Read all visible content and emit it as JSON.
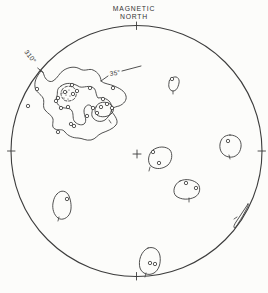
{
  "figure": {
    "kind": "contoured stereonet (equal-area projection) of poles",
    "bg_color": "#fcfcfa",
    "ink_color": "#3d3d3d"
  },
  "labels": {
    "north_line1": "MAGNETIC",
    "north_line2": "NORTH",
    "azimuth_310": "310°",
    "dip_35": "35°"
  },
  "chart_data": {
    "type": "scatter",
    "legend_position": "none",
    "grid": false,
    "projection_circle": {
      "cx": 136.5,
      "cy": 151,
      "r": 125.5
    },
    "center_cross": {
      "x": 137,
      "y": 154,
      "arm": 4
    },
    "boundary_ticks_deg": [
      0,
      90,
      180,
      270,
      310
    ],
    "labeled_orientation": {
      "strike_deg": 310,
      "dip_deg": 35
    },
    "contours": [
      {
        "name": "cluster-outer",
        "dashed": false,
        "path": "M 41 71 C 38 75 34 80 35 87 C 35.5 92 41 94 43 98 C 45 102 42 106 45 110 C 48 114 52 115 53 119 C 53.5 123 51 127 55 129 C 59 131 62 128 65 132 C 68 136 73 138 78 138 C 82 138 86 141 91 140 C 96 139 97 135 102 133 C 107 131 113 129 116 125 C 119 121 115 116 112 112 C 110 109 114 107 119 106 C 124 104 127 100 126 96 C 125 91 119 88 114 86 C 110 84 104 84 101 81 C 101 77 98 72 93 70 C 89 68 85 72 80 69 C 75 66 69 67 64 70 C 59 73 58 78 53 81 C 49 83 45 79 44 75 C 43 72 42 70 41 71 Z"
      },
      {
        "name": "cluster-middle",
        "dashed": false,
        "path": "M 61 86 C 66 82 73 83 78 86 C 82 89 87 85 92 87 C 97 89 95 94 98 98 C 103 97 109 99 111 104 C 113 110 110 116 105 120 C 100 123 94 121 92 116 C 91 112 94 109 91 106 C 88 103 84 107 84 111 C 84 116 87 119 85 123 C 83 126 78 125 75 122 C 72 119 74 115 72 111 C 70 107 65 109 61 107 C 57 105 55 100 57 96 C 58 92 56 89 61 86 Z"
      },
      {
        "name": "cluster-core-stippled",
        "dashed": true,
        "path": "M 62 90 C 64 86 70 85 74 88 C 77 90 77 95 75 98 C 73 101 67 102 64 100 C 61 97 60 93 62 90 Z"
      },
      {
        "name": "cluster-core-east",
        "dashed": false,
        "path": "M 96 107 C 97 103 103 101 108 103 C 113 105 115 109 112 113 C 109 117 101 118 97 115 C 94 112 95 109 96 107 Z"
      },
      {
        "name": "isolated-north",
        "dashed": false,
        "path": "M 172 78 C 176 75 180 78 179 83 C 178 88 176 91 173 91 C 170 91 168 87 169 83 C 169 80 170 79 172 78 Z"
      },
      {
        "name": "isolated-east",
        "dashed": false,
        "path": "M 230 135 C 237 135 242 140 241 147 C 240 154 235 158 229 157 C 223 156 219 151 220 144 C 221 138 225 135 230 135 Z"
      },
      {
        "name": "isolated-center",
        "dashed": false,
        "path": "M 153 150 C 158 146 166 146 170 150 C 173 154 172 161 168 165 C 163 169 156 170 151 166 C 147 162 148 154 153 150 Z"
      },
      {
        "name": "isolated-southeast-center",
        "dashed": false,
        "path": "M 180 181 C 186 178 194 180 198 184 C 201 188 200 194 195 197 C 189 200 181 200 176 196 C 172 192 174 184 180 181 Z"
      },
      {
        "name": "isolated-south",
        "dashed": false,
        "path": "M 148 248 C 154 246 159 250 160 256 C 161 263 159 270 154 273 C 149 276 142 274 140 268 C 138 261 141 251 148 248 Z"
      },
      {
        "name": "isolated-southwest",
        "dashed": false,
        "path": "M 57 194 C 61 189 67 191 69 196 C 71 201 72 208 70 213 C 68 218 62 221 58 218 C 54 215 52 209 53 203 C 54 198 55 196 57 194 Z"
      },
      {
        "name": "isolated-edge-sliver",
        "dashed": false,
        "path": "M 248 204 C 244 210 240 216 236 222 C 234 225 233 228 235 228 C 238 224 243 216 247 208 C 248 206 249 204 248 204 Z"
      }
    ],
    "points": [
      [
        37,
        89
      ],
      [
        28,
        106
      ],
      [
        72,
        85
      ],
      [
        90,
        88
      ],
      [
        113,
        88
      ],
      [
        77,
        91
      ],
      [
        65,
        92
      ],
      [
        73,
        94
      ],
      [
        58,
        98
      ],
      [
        56,
        101
      ],
      [
        103,
        99
      ],
      [
        61,
        108
      ],
      [
        68,
        107
      ],
      [
        93,
        108
      ],
      [
        101,
        107
      ],
      [
        107,
        104
      ],
      [
        112,
        108
      ],
      [
        97,
        113
      ],
      [
        87,
        116
      ],
      [
        71,
        124
      ],
      [
        74,
        126
      ],
      [
        58,
        132
      ],
      [
        172,
        79
      ],
      [
        228,
        141
      ],
      [
        153,
        152
      ],
      [
        159,
        163
      ],
      [
        186,
        183
      ],
      [
        196,
        188
      ],
      [
        150,
        263
      ],
      [
        155,
        264
      ],
      [
        67,
        199
      ]
    ],
    "stipple_dots": [
      [
        65,
        91
      ],
      [
        69,
        90
      ],
      [
        72,
        93
      ],
      [
        66,
        95
      ],
      [
        70,
        96
      ],
      [
        64,
        98
      ],
      [
        68,
        99
      ],
      [
        62,
        93
      ],
      [
        67,
        92
      ]
    ],
    "contour_ticks": [
      [
        229,
        155,
        230,
        159
      ],
      [
        150,
        167,
        149,
        171
      ],
      [
        189,
        198,
        189,
        202
      ],
      [
        146,
        273,
        145,
        277
      ],
      [
        59,
        217,
        58,
        221
      ],
      [
        237,
        217,
        234,
        219
      ],
      [
        109,
        120,
        111,
        123
      ],
      [
        173,
        91,
        173,
        94
      ]
    ],
    "leader_lines": [
      [
        101,
        81,
        108,
        76
      ],
      [
        122,
        71,
        141,
        66
      ]
    ]
  }
}
